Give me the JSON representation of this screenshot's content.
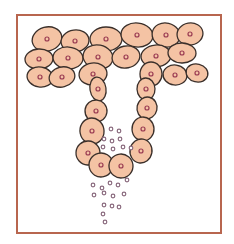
{
  "illustration": {
    "subject": "epithelial gland cells secreting granules",
    "frame_color": "#b8664f",
    "cell_fill": "#f4c3a4",
    "cell_stroke": "#3a2f2a",
    "nucleus_color": "#9a3b52",
    "granule_color": "#8a6a7e",
    "cells": [
      {
        "x": 47,
        "y": 39,
        "rx": 15,
        "ry": 12
      },
      {
        "x": 75,
        "y": 41,
        "rx": 14,
        "ry": 11
      },
      {
        "x": 106,
        "y": 39,
        "rx": 16,
        "ry": 12
      },
      {
        "x": 137,
        "y": 35,
        "rx": 16,
        "ry": 12
      },
      {
        "x": 166,
        "y": 35,
        "rx": 14,
        "ry": 12
      },
      {
        "x": 190,
        "y": 34,
        "rx": 13,
        "ry": 11
      },
      {
        "x": 39,
        "y": 59,
        "rx": 14,
        "ry": 10
      },
      {
        "x": 68,
        "y": 58,
        "rx": 15,
        "ry": 11
      },
      {
        "x": 98,
        "y": 57,
        "rx": 15,
        "ry": 12
      },
      {
        "x": 126,
        "y": 57,
        "rx": 14,
        "ry": 11
      },
      {
        "x": 156,
        "y": 56,
        "rx": 15,
        "ry": 11
      },
      {
        "x": 182,
        "y": 53,
        "rx": 14,
        "ry": 10
      },
      {
        "x": 40,
        "y": 77,
        "rx": 13,
        "ry": 10
      },
      {
        "x": 62,
        "y": 77,
        "rx": 13,
        "ry": 10
      },
      {
        "x": 93,
        "y": 74,
        "rx": 14,
        "ry": 11
      },
      {
        "x": 151,
        "y": 74,
        "rx": 11,
        "ry": 12
      },
      {
        "x": 175,
        "y": 75,
        "rx": 12,
        "ry": 10
      },
      {
        "x": 197,
        "y": 73,
        "rx": 11,
        "ry": 9
      },
      {
        "x": 98,
        "y": 89,
        "rx": 8,
        "ry": 12
      },
      {
        "x": 146,
        "y": 89,
        "rx": 9,
        "ry": 11
      },
      {
        "x": 96,
        "y": 111,
        "rx": 11,
        "ry": 11
      },
      {
        "x": 147,
        "y": 108,
        "rx": 10,
        "ry": 11
      },
      {
        "x": 92,
        "y": 131,
        "rx": 12,
        "ry": 13
      },
      {
        "x": 143,
        "y": 129,
        "rx": 11,
        "ry": 12
      },
      {
        "x": 88,
        "y": 153,
        "rx": 12,
        "ry": 12
      },
      {
        "x": 141,
        "y": 151,
        "rx": 11,
        "ry": 12
      },
      {
        "x": 101,
        "y": 165,
        "rx": 12,
        "ry": 12
      },
      {
        "x": 121,
        "y": 166,
        "rx": 12,
        "ry": 12
      }
    ],
    "granules": [
      [
        111,
        129
      ],
      [
        119,
        131
      ],
      [
        104,
        139
      ],
      [
        112,
        141
      ],
      [
        120,
        139
      ],
      [
        103,
        147
      ],
      [
        113,
        149
      ],
      [
        123,
        147
      ],
      [
        131,
        148
      ],
      [
        93,
        185
      ],
      [
        102,
        188
      ],
      [
        110,
        183
      ],
      [
        118,
        185
      ],
      [
        127,
        180
      ],
      [
        94,
        195
      ],
      [
        104,
        193
      ],
      [
        113,
        196
      ],
      [
        124,
        194
      ],
      [
        104,
        205
      ],
      [
        112,
        206
      ],
      [
        119,
        207
      ],
      [
        103,
        214
      ],
      [
        105,
        222
      ]
    ]
  }
}
